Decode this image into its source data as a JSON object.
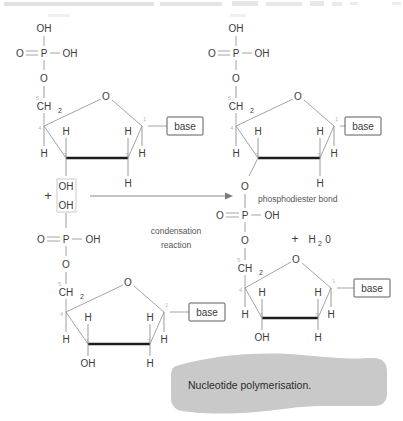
{
  "figure": {
    "caption": "Nucleotide polymerisation.",
    "background_color": "#ffffff",
    "caption_band_color": "#c9c9c9",
    "bond_color": "#9a9a9a",
    "thick_bond_color": "#1d1d1d",
    "atom_color": "#3b3b3b",
    "number_label_color": "#b9b9b9"
  },
  "annotations": {
    "plus_reactants": "+",
    "plus_product": "+",
    "water": "H",
    "water_sub": "2",
    "water_tail": "0",
    "condensation_line1": "condensation",
    "condensation_line2": "reaction",
    "phosphodiester": "phosphodiester bond"
  },
  "atoms": {
    "oh": "OH",
    "o": "O",
    "p": "P",
    "h": "H",
    "ch2": "CH",
    "ch2_sub": "2",
    "base": "base"
  },
  "ring_numbers": {
    "c5": "5",
    "c4": "4",
    "c3": "3",
    "c2": "2",
    "c1": "1"
  },
  "structures": [
    {
      "id": "top-left-nucleotide",
      "role": "reactant",
      "position": "top-left",
      "phosphate": {
        "top": "OH",
        "left_double": "O",
        "right": "OH",
        "bottom_ester": "O"
      },
      "sugar": {
        "c5_label": "CH2",
        "ring_oxygen": "O",
        "c4_h": "H",
        "c3_h": "H",
        "c2_h": "H",
        "c1_h": "H",
        "c3_substituent": "OH",
        "c2_substituent": "H",
        "c1_substituent": "base"
      }
    },
    {
      "id": "bottom-left-nucleotide",
      "role": "reactant",
      "position": "bottom-left",
      "phosphate": {
        "top": "OH",
        "left_double": "O",
        "right": "OH",
        "bottom_ester": "O"
      },
      "sugar": {
        "c5_label": "CH2",
        "ring_oxygen": "O",
        "c4_h": "H",
        "c3_h": "H",
        "c2_h": "H",
        "c1_h": "H",
        "c3_substituent": "OH",
        "c2_substituent": "H",
        "c1_substituent": "base"
      }
    },
    {
      "id": "top-right-nucleotide",
      "role": "product",
      "position": "top-right",
      "phosphate": {
        "top": "OH",
        "left_double": "O",
        "right": "OH",
        "bottom_ester": "O"
      },
      "sugar": {
        "c5_label": "CH2",
        "ring_oxygen": "O",
        "c4_h": "H",
        "c3_h": "H",
        "c2_h": "H",
        "c1_h": "H",
        "c3_substituent": "O",
        "c2_substituent": "H",
        "c1_substituent": "base"
      }
    },
    {
      "id": "bottom-right-nucleotide",
      "role": "product",
      "position": "bottom-right",
      "phosphate": {
        "left_double": "O",
        "right": "OH",
        "bottom_ester": "O"
      },
      "sugar": {
        "c5_label": "CH2",
        "ring_oxygen": "O",
        "c4_h": "H",
        "c3_h": "H",
        "c2_h": "H",
        "c1_h": "H",
        "c3_substituent": "OH",
        "c2_substituent": "H",
        "c1_substituent": "base"
      }
    }
  ],
  "highlight": {
    "label": "reactive-hydroxyl-highlight",
    "oh_upper": "OH",
    "oh_lower": "OH"
  }
}
